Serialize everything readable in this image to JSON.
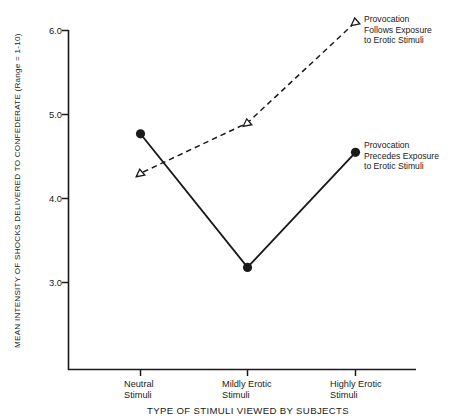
{
  "chart_data": {
    "type": "line",
    "title": "",
    "xlabel": "TYPE OF STIMULI VIEWED BY SUBJECTS",
    "ylabel": "MEAN INTENSITY OF SHOCKS DELIVERED TO CONFEDERATE (Range = 1-10)",
    "categories": [
      "Neutral\nStimuli",
      "Mildly Erotic\nStimuli",
      "Highly Erotic\nStimuli"
    ],
    "ytick_labels": [
      "6.0",
      "5.0",
      "4.0",
      "3.0"
    ],
    "ytick_values": [
      6.0,
      5.0,
      4.0,
      3.0
    ],
    "ylim": [
      2.0,
      6.2
    ],
    "grid": false,
    "legend_position": "inline-annotations",
    "series": [
      {
        "name": "Provocation Follows Exposure to Erotic Stimuli",
        "values": [
          4.3,
          4.9,
          6.1
        ],
        "line_style": "dashed",
        "marker": "open-triangle",
        "color": "#1a1a1a"
      },
      {
        "name": "Provocation Precedes Exposure to Erotic Stimuli",
        "values": [
          4.77,
          3.18,
          4.55
        ],
        "line_style": "solid",
        "marker": "filled-circle",
        "color": "#1a1a1a"
      }
    ],
    "annotations": [
      "Provocation\nFollows Exposure\nto Erotic Stimuli",
      "Provocation\nPrecedes Exposure\nto Erotic Stimuli"
    ]
  },
  "colors": {
    "ink": "#1a1a1a",
    "background": "#ffffff"
  }
}
